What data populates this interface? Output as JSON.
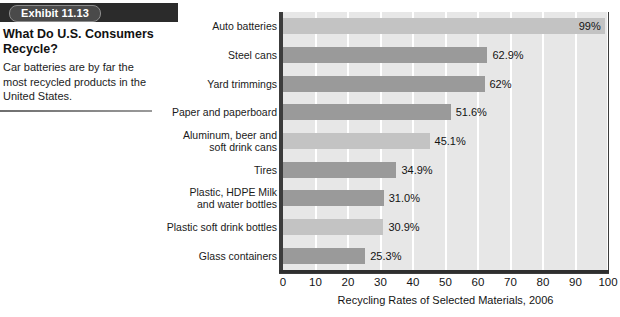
{
  "exhibit": {
    "badge_label": "Exhibit 11.13",
    "title": "What Do U.S. Consumers Recycle?",
    "description": "Car batteries are by far the most recycled products in the United States."
  },
  "colors": {
    "banner": "#2b2b2b",
    "badge": "#4a4a4a",
    "plot_background": "#e7e7e7",
    "gridline": "#ffffff",
    "bar_light": "#c3c3c3",
    "bar_dark": "#9a9a9a",
    "axis": "#2f2f2f"
  },
  "chart_data": {
    "type": "bar",
    "orientation": "horizontal",
    "title": "",
    "xlabel": "Recycling Rates of Selected Materials, 2006",
    "ylabel": "",
    "xlim": [
      0,
      100
    ],
    "xticks": [
      0,
      10,
      20,
      30,
      40,
      50,
      60,
      70,
      80,
      90,
      100
    ],
    "grid": "vertical",
    "legend": "none",
    "categories": [
      "Auto batteries",
      "Steel cans",
      "Yard trimmings",
      "Paper and paperboard",
      "Aluminum, beer and soft drink cans",
      "Tires",
      "Plastic, HDPE Milk and water bottles",
      "Plastic soft drink bottles",
      "Glass containers"
    ],
    "values": [
      99,
      62.9,
      62,
      51.6,
      45.1,
      34.9,
      31.0,
      30.9,
      25.3
    ],
    "data_labels": [
      "99%",
      "62.9%",
      "62%",
      "51.6%",
      "45.1%",
      "34.9%",
      "31.0%",
      "30.9%",
      "25.3%"
    ],
    "bar_shades": [
      "light",
      "dark",
      "dark",
      "dark",
      "light",
      "dark",
      "dark",
      "light",
      "dark"
    ],
    "category_lines": [
      [
        "Auto batteries"
      ],
      [
        "Steel cans"
      ],
      [
        "Yard trimmings"
      ],
      [
        "Paper and paperboard"
      ],
      [
        "Aluminum, beer and",
        "soft drink cans"
      ],
      [
        "Tires"
      ],
      [
        "Plastic, HDPE Milk",
        "and water bottles"
      ],
      [
        "Plastic soft drink bottles"
      ],
      [
        "Glass containers"
      ]
    ]
  }
}
